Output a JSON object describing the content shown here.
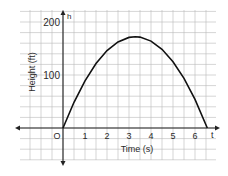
{
  "chart_data": {
    "type": "line",
    "title": "",
    "xlabel": "Time (s)",
    "ylabel": "Height (ft)",
    "x_axis_name": "t",
    "y_axis_name": "h",
    "origin_label": "O",
    "x_ticks": [
      "1",
      "2",
      "3",
      "4",
      "5",
      "6"
    ],
    "y_ticks": [
      "100",
      "200"
    ],
    "xlim": [
      -2,
      7
    ],
    "ylim": [
      -60,
      220
    ],
    "grid": true,
    "grid_step_x": 0.5,
    "grid_step_y": 20,
    "legend": null,
    "series": [
      {
        "name": "h(t)",
        "equation": "h = 105t - 16t^2",
        "x": [
          0,
          0.5,
          1,
          1.5,
          2,
          2.5,
          3,
          3.28,
          3.5,
          4,
          4.5,
          5,
          5.5,
          6,
          6.56
        ],
        "y": [
          0,
          48.5,
          89,
          121.5,
          146,
          162.5,
          171,
          172.3,
          171.5,
          164,
          148.5,
          125,
          93.5,
          54,
          0
        ]
      }
    ]
  },
  "colors": {
    "grid": "#b8b8b8",
    "axis": "#222222",
    "curve": "#111111",
    "text": "#2a2a2a"
  }
}
